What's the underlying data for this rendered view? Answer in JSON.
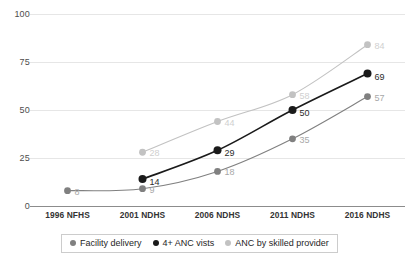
{
  "chart_data": {
    "type": "line",
    "title": "",
    "subtitle": "",
    "xlabel": "",
    "ylabel": "",
    "categories": [
      "1996 NFHS",
      "2001 NDHS",
      "2006 NDHS",
      "2011 NDHS",
      "2016 NDHS"
    ],
    "ylim": [
      0,
      100
    ],
    "yticks": [
      0,
      25,
      50,
      75,
      100
    ],
    "ytick_labels": [
      "0",
      "25",
      "50",
      "75",
      "100"
    ],
    "grid": true,
    "grid_axis": "y",
    "legend_position": "bottom",
    "series": [
      {
        "name": "Facility delivery",
        "color": "#808080",
        "label_color": "#a8a8a8",
        "values": [
          8,
          9,
          18,
          35,
          57
        ],
        "labels": [
          "8",
          "9",
          "18",
          "35",
          "57"
        ]
      },
      {
        "name": "4+ ANC vists",
        "color": "#1a1a1a",
        "label_color": "#2b2b2b",
        "values": [
          null,
          14,
          29,
          50,
          69
        ],
        "labels": [
          "",
          "14",
          "29",
          "50",
          "69"
        ]
      },
      {
        "name": "ANC by skilled provider",
        "color": "#c2c2c2",
        "label_color": "#cfcfcf",
        "values": [
          null,
          28,
          44,
          58,
          84
        ],
        "labels": [
          "",
          "28",
          "44",
          "58",
          "84"
        ]
      }
    ]
  },
  "legend": {
    "items": [
      {
        "label": "Facility delivery",
        "color": "#808080"
      },
      {
        "label": "4+ ANC vists",
        "color": "#1a1a1a"
      },
      {
        "label": "ANC by skilled provider",
        "color": "#c2c2c2"
      }
    ]
  },
  "colors": {
    "facility_delivery": "#808080",
    "anc_4plus": "#1a1a1a",
    "anc_skilled_provider": "#c2c2c2",
    "gridline": "#e6e6e6",
    "axis": "#8c8c8c",
    "background": "#ffffff"
  }
}
